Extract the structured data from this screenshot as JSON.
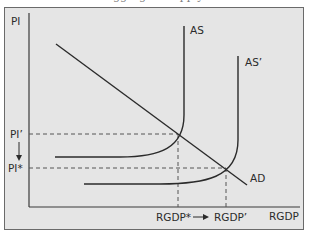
{
  "figure": {
    "caption_fragment": "aggregate supply",
    "background": "#e5e5e5",
    "border_color": "#6a6a6a",
    "line_color": "#2b2b2b",
    "dash_color": "#555555"
  },
  "axes": {
    "y_label": "PI",
    "x_label": "RGDP"
  },
  "curves": {
    "as_label": "AS",
    "as_prime_label": "AS’",
    "ad_label": "AD"
  },
  "price_levels": {
    "initial_label": "PI’",
    "final_label": "PI*",
    "arrow": "↓"
  },
  "output_levels": {
    "initial_label": "RGDP*",
    "final_label": "RGDP’",
    "arrow": "→"
  }
}
